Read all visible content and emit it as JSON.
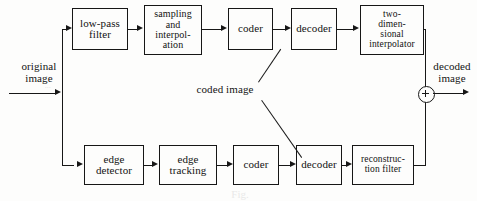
{
  "figure": {
    "type": "block-diagram",
    "caption_ghost": "Fig."
  },
  "inputs": {
    "original_image_label": "original\nimage",
    "artifact_under_original": "···"
  },
  "outputs": {
    "decoded_image_label": "decoded\nimage"
  },
  "annotations": {
    "coded_image_label": "coded image"
  },
  "top_branch": {
    "blocks": [
      {
        "id": "low-pass-filter",
        "label": "low-pass\nfilter"
      },
      {
        "id": "sampling-interpolation",
        "label": "sampling\nand\ninterpol-\nation"
      },
      {
        "id": "coder-top",
        "label": "coder"
      },
      {
        "id": "decoder-top",
        "label": "decoder"
      },
      {
        "id": "two-dimensional-interpolator",
        "label": "two-\ndimen-\nsional\ninterpolator"
      }
    ]
  },
  "bottom_branch": {
    "blocks": [
      {
        "id": "edge-detector",
        "label": "edge\ndetector"
      },
      {
        "id": "edge-tracking",
        "label": "edge\ntracking"
      },
      {
        "id": "coder-bottom",
        "label": "coder"
      },
      {
        "id": "decoder-bottom",
        "label": "decoder"
      },
      {
        "id": "reconstruction-filter",
        "label": "reconstruc-\ntion  filter"
      }
    ]
  },
  "junction": {
    "symbol": "+",
    "name": "summing-junction"
  },
  "colors": {
    "ink": "#161616",
    "paper": "#fdfdfc"
  }
}
